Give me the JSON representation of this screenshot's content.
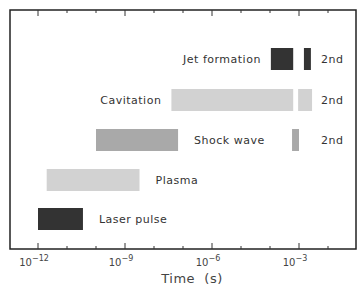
{
  "chart_data": {
    "type": "bar",
    "subtype": "horizontal-range-log",
    "title": "",
    "xlabel": "Time  (s)",
    "ylabel": "",
    "xscale": "log",
    "xlim_log10": [
      -13.0,
      -1.15
    ],
    "grid": false,
    "tick_labels": [
      {
        "exp": -12,
        "base": "10",
        "sup": "−12"
      },
      {
        "exp": -9,
        "base": "10",
        "sup": "−9"
      },
      {
        "exp": -6,
        "base": "10",
        "sup": "−6"
      },
      {
        "exp": -3,
        "base": "10",
        "sup": "−3"
      }
    ],
    "series": [
      {
        "name": "Jet formation",
        "color": "#333333",
        "label_side": "left",
        "ranges_log10": [
          [
            -3.97,
            -3.2
          ]
        ],
        "second": {
          "range_log10": [
            -2.83,
            -2.59
          ],
          "label": "2nd"
        }
      },
      {
        "name": "Cavitation",
        "color": "#d2d2d2",
        "label_side": "left",
        "ranges_log10": [
          [
            -7.4,
            -3.2
          ]
        ],
        "second": {
          "range_log10": [
            -3.03,
            -2.55
          ],
          "label": "2nd"
        }
      },
      {
        "name": "Shock wave",
        "color": "#a9a9a9",
        "label_side": "right",
        "ranges_log10": [
          [
            -10.0,
            -7.17
          ]
        ],
        "second": {
          "range_log10": [
            -3.24,
            -3.0
          ],
          "label": "2nd"
        }
      },
      {
        "name": "Plasma",
        "color": "#d2d2d2",
        "label_side": "right",
        "ranges_log10": [
          [
            -11.7,
            -8.5
          ]
        ]
      },
      {
        "name": "Laser pulse",
        "color": "#333333",
        "label_side": "right",
        "ranges_log10": [
          [
            -12.0,
            -10.45
          ]
        ]
      }
    ]
  }
}
